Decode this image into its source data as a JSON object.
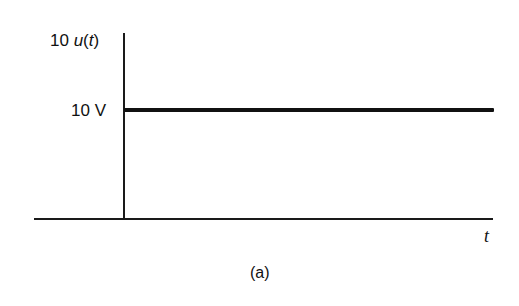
{
  "figure": {
    "caption": "(a)",
    "y_axis_label_prefix": "10 ",
    "y_axis_label_func": "u",
    "y_axis_label_paren_open": "(",
    "y_axis_label_var": "t",
    "y_axis_label_paren_close": ")",
    "level_label": "10 V",
    "x_axis_label": "t"
  },
  "chart_data": {
    "type": "line",
    "title": "",
    "xlabel": "t",
    "ylabel": "10 u(t)",
    "series": [
      {
        "name": "10 u(t)",
        "x": [
          0,
          0,
          1
        ],
        "values": [
          0,
          10,
          10
        ]
      }
    ],
    "annotations": [
      "10 V",
      "(a)"
    ],
    "grid": false,
    "legend": "none"
  }
}
